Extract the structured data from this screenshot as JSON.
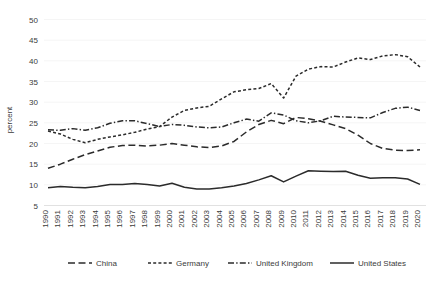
{
  "chart_data": {
    "type": "line",
    "title": "",
    "xlabel": "",
    "ylabel": "percent",
    "ylim": [
      0,
      50
    ],
    "y_ticks": [
      5,
      10,
      15,
      20,
      25,
      30,
      35,
      40,
      45,
      50
    ],
    "grid": true,
    "legend_position": "bottom",
    "categories": [
      "1990",
      "1991",
      "1992",
      "1993",
      "1994",
      "1995",
      "1996",
      "1997",
      "1998",
      "1999",
      "2000",
      "2001",
      "2002",
      "2003",
      "2004",
      "2005",
      "2006",
      "2007",
      "2008",
      "2009",
      "2010",
      "2011",
      "2012",
      "2013",
      "2014",
      "2015",
      "2016",
      "2017",
      "2018",
      "2019",
      "2020"
    ],
    "series": [
      {
        "name": "China",
        "dash": "long-dash",
        "values": [
          14.0,
          15.0,
          16.2,
          17.3,
          18.2,
          19.1,
          19.5,
          19.6,
          19.4,
          19.6,
          20.0,
          19.6,
          19.2,
          19.0,
          19.4,
          20.5,
          22.8,
          24.6,
          25.6,
          24.8,
          26.3,
          26.0,
          25.4,
          24.5,
          23.6,
          22.0,
          20.0,
          18.8,
          18.4,
          18.3,
          18.5
        ]
      },
      {
        "name": "Germany",
        "dash": "short-dash",
        "values": [
          23.0,
          22.3,
          21.0,
          20.2,
          21.0,
          21.6,
          22.1,
          22.7,
          23.5,
          24.1,
          26.4,
          28.0,
          28.6,
          29.0,
          30.8,
          32.5,
          33.0,
          33.3,
          34.5,
          31.0,
          36.3,
          38.0,
          38.6,
          38.5,
          39.7,
          40.7,
          40.3,
          41.2,
          41.5,
          41.0,
          38.5
        ]
      },
      {
        "name": "United Kingdom",
        "dash": "dash-dot",
        "values": [
          23.3,
          23.2,
          23.6,
          23.2,
          23.8,
          24.9,
          25.5,
          25.5,
          24.8,
          24.1,
          24.6,
          24.4,
          24.0,
          23.8,
          24.0,
          25.0,
          25.9,
          25.4,
          27.4,
          26.9,
          25.5,
          25.0,
          25.5,
          26.6,
          26.4,
          26.3,
          26.2,
          27.5,
          28.5,
          28.8,
          28.0
        ]
      },
      {
        "name": "United States",
        "dash": "solid",
        "values": [
          9.3,
          9.6,
          9.4,
          9.3,
          9.6,
          10.1,
          10.1,
          10.3,
          10.1,
          9.7,
          10.4,
          9.4,
          9.0,
          9.0,
          9.3,
          9.7,
          10.3,
          11.2,
          12.2,
          10.7,
          12.1,
          13.4,
          13.3,
          13.2,
          13.3,
          12.3,
          11.6,
          11.7,
          11.7,
          11.4,
          10.1
        ]
      }
    ]
  },
  "legend": {
    "items": [
      {
        "label": "China"
      },
      {
        "label": "Germany"
      },
      {
        "label": "United Kingdom"
      },
      {
        "label": "United States"
      }
    ]
  },
  "axes": {
    "y_title": "percent"
  }
}
